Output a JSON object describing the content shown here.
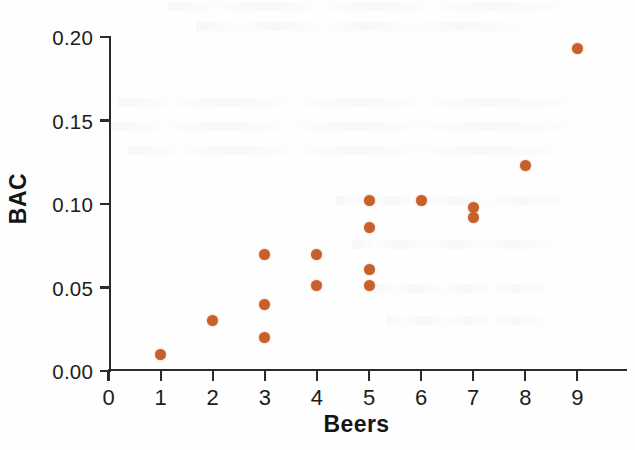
{
  "chart_data": {
    "type": "scatter",
    "title": "",
    "xlabel": "Beers",
    "ylabel": "BAC",
    "xlim": [
      0,
      9.6
    ],
    "ylim": [
      0.0,
      0.205
    ],
    "grid": false,
    "legend": "none",
    "marker_color": "#c8602c",
    "axis_color": "#2b2b2b",
    "x_ticks": [
      "0",
      "1",
      "2",
      "3",
      "4",
      "5",
      "6",
      "7",
      "8",
      "9"
    ],
    "x_tick_values": [
      0,
      1,
      2,
      3,
      4,
      5,
      6,
      7,
      8,
      9
    ],
    "y_ticks": [
      "0.00",
      "0.05",
      "0.10",
      "0.15",
      "0.20"
    ],
    "y_tick_values": [
      0.0,
      0.05,
      0.1,
      0.15,
      0.2
    ],
    "points": [
      {
        "x": 1,
        "y": 0.01
      },
      {
        "x": 2,
        "y": 0.03
      },
      {
        "x": 3,
        "y": 0.07
      },
      {
        "x": 3,
        "y": 0.04
      },
      {
        "x": 3,
        "y": 0.02
      },
      {
        "x": 4,
        "y": 0.07
      },
      {
        "x": 4,
        "y": 0.051
      },
      {
        "x": 5,
        "y": 0.102
      },
      {
        "x": 5,
        "y": 0.086
      },
      {
        "x": 5,
        "y": 0.061
      },
      {
        "x": 5,
        "y": 0.051
      },
      {
        "x": 6,
        "y": 0.102
      },
      {
        "x": 7,
        "y": 0.098
      },
      {
        "x": 7,
        "y": 0.092
      },
      {
        "x": 8,
        "y": 0.123
      },
      {
        "x": 9,
        "y": 0.193
      }
    ]
  },
  "axes": {
    "x_title": "Beers",
    "y_title": "BAC"
  }
}
